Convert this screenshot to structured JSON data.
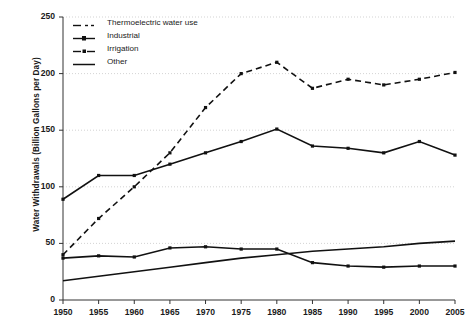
{
  "chart_data": {
    "type": "line",
    "title": "",
    "xlabel": "",
    "ylabel": "Water Withdrawals (Billion Gallons per Day)",
    "x": [
      1950,
      1955,
      1960,
      1965,
      1970,
      1975,
      1980,
      1985,
      1990,
      1995,
      2000,
      2005
    ],
    "xticklabels": [
      "1950",
      "1955",
      "1960",
      "1965",
      "1970",
      "1975",
      "1980",
      "1985",
      "1990",
      "1995",
      "2000",
      "2005"
    ],
    "yticklabels": [
      "0",
      "50",
      "100",
      "150",
      "200",
      "250"
    ],
    "yticks": [
      0,
      50,
      100,
      150,
      200,
      250
    ],
    "ylim": [
      0,
      250
    ],
    "grid": true,
    "legend_position": "upper-left",
    "series": [
      {
        "name": "Thermoelectric water use",
        "style": "dashed",
        "values": [
          40,
          72,
          100,
          130,
          170,
          200,
          210,
          187,
          195,
          190,
          195,
          201
        ]
      },
      {
        "name": "Industrial",
        "style": "solid-marker",
        "values": [
          37,
          39,
          38,
          46,
          47,
          45,
          45,
          33,
          30,
          29,
          30,
          30
        ]
      },
      {
        "name": "Irrigation",
        "style": "solid-marker",
        "values": [
          89,
          110,
          110,
          120,
          130,
          140,
          151,
          136,
          134,
          130,
          140,
          128
        ]
      },
      {
        "name": "Other",
        "style": "solid",
        "values": [
          17,
          21,
          25,
          29,
          33,
          37,
          40,
          43,
          45,
          47,
          50,
          52
        ]
      }
    ]
  },
  "legend": {
    "items": [
      {
        "label": "Thermoelectric water use",
        "key": "dashed-line-key"
      },
      {
        "label": "Industrial",
        "key": "solid-marker-line-key"
      },
      {
        "label": "Irrigation",
        "key": "solid-marker-line-key"
      },
      {
        "label": "Other",
        "key": "solid-line-key"
      }
    ]
  }
}
